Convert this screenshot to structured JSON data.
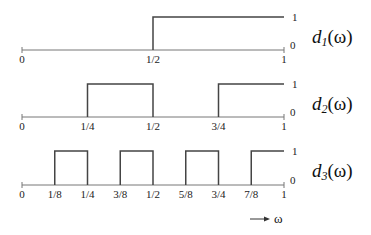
{
  "axis": {
    "x_start": 22,
    "x_end": 284
  },
  "arrow": {
    "label": "ω",
    "x1": 250,
    "x2": 270,
    "y": 219
  },
  "plots": [
    {
      "id": "d1",
      "label_base": "d",
      "label_sub": "1",
      "label_rest": "(ω)",
      "baseline_y": 50,
      "top_y": 17,
      "label_one": "1",
      "label_zero": "0",
      "high_intervals": [
        [
          0.5,
          1.0
        ]
      ],
      "ticks": [
        {
          "pos": 0,
          "label": "0"
        },
        {
          "pos": 0.5,
          "label": "1/2"
        },
        {
          "pos": 1,
          "label": "1"
        }
      ]
    },
    {
      "id": "d2",
      "label_base": "d",
      "label_sub": "2",
      "label_rest": "(ω)",
      "baseline_y": 117,
      "top_y": 84,
      "label_one": "1",
      "label_zero": "0",
      "high_intervals": [
        [
          0.25,
          0.5
        ],
        [
          0.75,
          1.0
        ]
      ],
      "ticks": [
        {
          "pos": 0,
          "label": "0"
        },
        {
          "pos": 0.25,
          "label": "1/4"
        },
        {
          "pos": 0.5,
          "label": "1/2"
        },
        {
          "pos": 0.75,
          "label": "3/4"
        },
        {
          "pos": 1,
          "label": "1"
        }
      ]
    },
    {
      "id": "d3",
      "label_base": "d",
      "label_sub": "3",
      "label_rest": "(ω)",
      "baseline_y": 185,
      "top_y": 151,
      "label_one": "1",
      "label_zero": "0",
      "high_intervals": [
        [
          0.125,
          0.25
        ],
        [
          0.375,
          0.5
        ],
        [
          0.625,
          0.75
        ],
        [
          0.875,
          1.0
        ]
      ],
      "ticks": [
        {
          "pos": 0,
          "label": "0"
        },
        {
          "pos": 0.125,
          "label": "1/8"
        },
        {
          "pos": 0.25,
          "label": "1/4"
        },
        {
          "pos": 0.375,
          "label": "3/8"
        },
        {
          "pos": 0.5,
          "label": "1/2"
        },
        {
          "pos": 0.625,
          "label": "5/8"
        },
        {
          "pos": 0.75,
          "label": "3/4"
        },
        {
          "pos": 0.875,
          "label": "7/8"
        },
        {
          "pos": 1,
          "label": "1"
        }
      ]
    }
  ]
}
